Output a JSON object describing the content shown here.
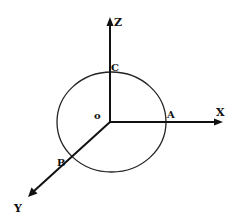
{
  "diagram": {
    "type": "3d-coordinate-axes-with-circle",
    "colors": {
      "stroke": "#111111",
      "background": "#ffffff"
    },
    "origin": {
      "x": 110,
      "y": 122,
      "label": "o"
    },
    "axes": {
      "z": {
        "label": "Z",
        "end": {
          "x": 110,
          "y": 18
        }
      },
      "x": {
        "label": "X",
        "end": {
          "x": 222,
          "y": 122
        }
      },
      "y": {
        "label": "Y",
        "end": {
          "x": 28,
          "y": 197
        }
      }
    },
    "circle": {
      "cx": 111.5,
      "cy": 122,
      "rx": 54.5,
      "ry": 50
    },
    "points": {
      "a": {
        "label": "A"
      },
      "b": {
        "label": "B"
      },
      "c": {
        "label": "C"
      }
    }
  }
}
